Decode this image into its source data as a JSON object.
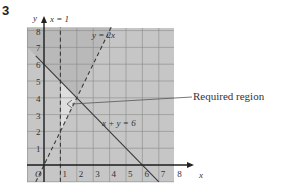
{
  "question_number": "3",
  "chart_data": {
    "type": "line",
    "title": "",
    "xlabel": "x",
    "ylabel": "y",
    "origin_label": "O",
    "xlim": [
      -0.5,
      8.5
    ],
    "ylim": [
      -1,
      8.2
    ],
    "x_ticks": [
      1,
      2,
      3,
      4,
      5,
      6,
      7,
      8
    ],
    "y_ticks": [
      1,
      2,
      3,
      4,
      5,
      6,
      7,
      8
    ],
    "grid": true,
    "lines": [
      {
        "name": "x = 1",
        "equation": "x = 1",
        "style": "dashed",
        "points": [
          [
            1,
            -1
          ],
          [
            1,
            8.2
          ]
        ]
      },
      {
        "name": "y = 2x",
        "equation": "y = 2x",
        "style": "dashed",
        "points": [
          [
            -0.5,
            -1
          ],
          [
            4.1,
            8.2
          ]
        ]
      },
      {
        "name": "x + y = 6",
        "equation": "x + y = 6",
        "style": "solid",
        "points": [
          [
            -0.5,
            6.5
          ],
          [
            7,
            -1
          ]
        ]
      }
    ],
    "required_region": {
      "label": "Required region",
      "vertices": [
        [
          1,
          2
        ],
        [
          2,
          4
        ],
        [
          1,
          5
        ]
      ],
      "description": "Unshaded triangle bounded by x = 1, y = 2x and x + y = 6"
    },
    "colors": {
      "shaded": "#c6c6c6",
      "shaded_dark": "#b9b9b9",
      "required": "#dedede",
      "grid": "#8a8a8a",
      "axis": "#222222",
      "line": "#3a3a3a"
    }
  }
}
